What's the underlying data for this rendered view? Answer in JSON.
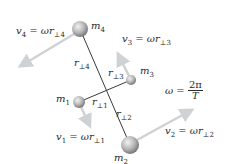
{
  "diagram": {
    "masses": [
      {
        "id": "m1",
        "label": "m",
        "sub": "1",
        "cx": 79,
        "cy": 102,
        "r": 6
      },
      {
        "id": "m2",
        "label": "m",
        "sub": "2",
        "cx": 130,
        "cy": 145,
        "r": 9
      },
      {
        "id": "m3",
        "label": "m",
        "sub": "3",
        "cx": 131,
        "cy": 80,
        "r": 5
      },
      {
        "id": "m4",
        "label": "m",
        "sub": "4",
        "cx": 80,
        "cy": 29,
        "r": 8
      }
    ],
    "radii": [
      {
        "id": "r1",
        "label": "r",
        "sub": "⊥1"
      },
      {
        "id": "r2",
        "label": "r",
        "sub": "⊥2"
      },
      {
        "id": "r3",
        "label": "r",
        "sub": "⊥3"
      },
      {
        "id": "r4",
        "label": "r",
        "sub": "⊥4"
      }
    ],
    "velocities": [
      {
        "id": "v1",
        "lhs": "v",
        "lhs_sub": "1",
        "eq": " = ωr",
        "rhs_sub": "⊥1"
      },
      {
        "id": "v2",
        "lhs": "v",
        "lhs_sub": "2",
        "eq": " = ωr",
        "rhs_sub": "⊥2"
      },
      {
        "id": "v3",
        "lhs": "v",
        "lhs_sub": "3",
        "eq": " = ωr",
        "rhs_sub": "⊥3"
      },
      {
        "id": "v4",
        "lhs": "v",
        "lhs_sub": "4",
        "eq": " = ωr",
        "rhs_sub": "⊥4"
      }
    ],
    "omega": {
      "lhs": "ω = ",
      "numerator": "2π",
      "denominator": "T"
    },
    "colors": {
      "rod": "#3a3a3a",
      "arrow": "#cfd2d4",
      "sphere_light": "#e6e6e6",
      "sphere_dark": "#7a7a7a"
    }
  }
}
